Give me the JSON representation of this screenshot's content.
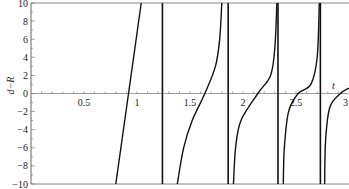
{
  "chart_data": {
    "type": "line",
    "title": "",
    "xlabel": "t",
    "ylabel": "d−R",
    "xlim": [
      0,
      3
    ],
    "ylim": [
      -10,
      10
    ],
    "grid": false,
    "legend": null,
    "x_ticks": [
      "0.5",
      "1",
      "1.5",
      "2",
      "2.5",
      "3"
    ],
    "y_ticks": [
      "10",
      "8",
      "6",
      "4",
      "2",
      "0",
      "−2",
      "−4",
      "−6",
      "−8",
      "−10"
    ],
    "vertical_asymptotes": [
      1.24,
      1.86,
      2.33,
      2.73
    ],
    "series": [
      {
        "name": "branch-1",
        "points": [
          [
            0.8,
            -10
          ],
          [
            0.86,
            -5
          ],
          [
            0.92,
            0
          ],
          [
            0.98,
            5
          ],
          [
            1.04,
            10
          ]
        ]
      },
      {
        "name": "branch-2",
        "points": [
          [
            1.38,
            -10
          ],
          [
            1.44,
            -6
          ],
          [
            1.52,
            -3
          ],
          [
            1.64,
            0
          ],
          [
            1.74,
            3
          ],
          [
            1.78,
            6
          ],
          [
            1.8,
            10
          ]
        ]
      },
      {
        "name": "branch-3",
        "points": [
          [
            1.91,
            -10
          ],
          [
            1.93,
            -6
          ],
          [
            1.98,
            -3
          ],
          [
            2.14,
            0
          ],
          [
            2.26,
            2
          ],
          [
            2.3,
            5
          ],
          [
            2.32,
            10
          ]
        ]
      },
      {
        "name": "branch-4",
        "points": [
          [
            2.38,
            -10
          ],
          [
            2.39,
            -6
          ],
          [
            2.43,
            -2
          ],
          [
            2.52,
            0
          ],
          [
            2.64,
            1
          ],
          [
            2.7,
            4
          ],
          [
            2.72,
            10
          ]
        ]
      },
      {
        "name": "branch-5",
        "points": [
          [
            2.77,
            -10
          ],
          [
            2.78,
            -5
          ],
          [
            2.82,
            -1.5
          ],
          [
            2.92,
            0
          ],
          [
            3.0,
            0.6
          ]
        ]
      }
    ]
  },
  "axes": {
    "x_label": "t",
    "y_label": "d−R"
  }
}
